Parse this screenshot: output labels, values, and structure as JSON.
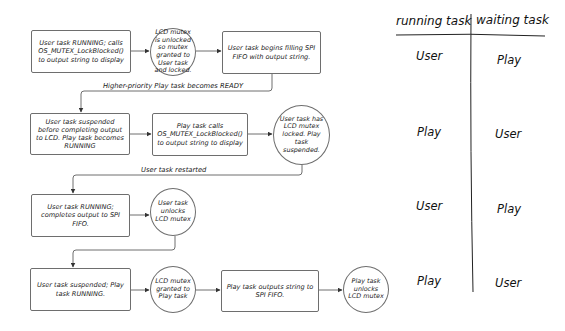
{
  "flow": {
    "row1": {
      "box1": "User task RUNNING; calls OS_MUTEX_LockBlocked() to output string to display",
      "circle": "LCD mutex is unlocked so mutex granted to User task and locked.",
      "box2": "User task begins filling SPI FIFO with output string."
    },
    "transition1": "Higher-priority Play task becomes READY",
    "row2": {
      "box1": "User task suspended before completing output to LCD. Play task becomes RUNNING",
      "box2": "Play task calls OS_MUTEX_LockBlocked() to output string to display",
      "circle": "User task has LCD mutex locked. Play task suspended."
    },
    "transition2": "User task restarted",
    "row3": {
      "box1": "User task RUNNING; completes output to SPI FIFO.",
      "circle": "User task unlocks LCD mutex"
    },
    "row4": {
      "box1": "User task suspended; Play task RUNNING.",
      "circle1": "LCD mutex granted to Play task",
      "box2": "Play task outputs string to SPI FIFO.",
      "circle2": "Play task unlocks LCD mutex"
    }
  },
  "table": {
    "headers": {
      "running": "running task",
      "waiting": "waiting task"
    },
    "rows": [
      {
        "running": "User",
        "waiting": "Play"
      },
      {
        "running": "Play",
        "waiting": "User"
      },
      {
        "running": "User",
        "waiting": "Play"
      },
      {
        "running": "Play",
        "waiting": "User"
      }
    ]
  },
  "colors": {
    "stroke": "#6e6e6e",
    "text": "#222222"
  }
}
